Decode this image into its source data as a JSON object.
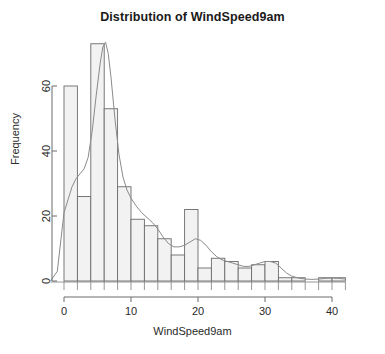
{
  "chart_data": {
    "type": "bar",
    "title": "Distribution of WindSpeed9am",
    "xlabel": "WindSpeed9am",
    "ylabel": "Frequency",
    "xlim": [
      -2,
      42
    ],
    "ylim": [
      0,
      76
    ],
    "grid": false,
    "legend": "none",
    "bin_width": 2,
    "bin_starts": [
      0,
      2,
      4,
      6,
      8,
      10,
      12,
      14,
      16,
      18,
      20,
      22,
      24,
      26,
      28,
      30,
      32,
      34,
      36,
      38,
      40
    ],
    "categories": [
      "0-2",
      "2-4",
      "4-6",
      "6-8",
      "8-10",
      "10-12",
      "12-14",
      "14-16",
      "16-18",
      "18-20",
      "20-22",
      "22-24",
      "24-26",
      "26-28",
      "28-30",
      "30-32",
      "32-34",
      "34-36",
      "36-38",
      "38-40",
      "40-42"
    ],
    "values": [
      60,
      26,
      73,
      53,
      29,
      19,
      17,
      13,
      8,
      22,
      4,
      7,
      6,
      4,
      5,
      6,
      1,
      1,
      0,
      1,
      1
    ],
    "xticks": [
      0,
      10,
      20,
      30,
      40
    ],
    "xtick_labels": [
      "0",
      "10",
      "20",
      "30",
      "40"
    ],
    "yticks": [
      0,
      20,
      40,
      60
    ],
    "ytick_labels": [
      "0",
      "20",
      "40",
      "60"
    ],
    "overlay": {
      "name": "density-curve",
      "type": "line",
      "x": [
        -2.0,
        -1.0,
        0.0,
        0.6,
        1.2,
        1.8,
        2.4,
        3.0,
        3.6,
        4.2,
        4.8,
        5.4,
        5.8,
        6.2,
        6.6,
        7.0,
        7.6,
        8.2,
        8.8,
        9.4,
        10.0,
        10.8,
        11.6,
        12.4,
        13.2,
        14.0,
        14.8,
        15.6,
        16.4,
        17.2,
        18.0,
        18.8,
        19.6,
        20.4,
        21.2,
        22.0,
        22.8,
        23.6,
        24.4,
        25.2,
        26.0,
        26.8,
        27.6,
        28.4,
        29.2,
        30.0,
        30.8,
        31.6,
        32.4,
        33.2,
        34.0,
        35.0,
        36.0,
        37.0,
        38.0,
        39.0,
        40.0,
        41.0,
        42.0
      ],
      "y": [
        0.0,
        3.0,
        21.0,
        25.0,
        29.0,
        31.5,
        33.0,
        34.5,
        38.0,
        46.0,
        57.0,
        67.0,
        72.0,
        73.5,
        70.0,
        63.0,
        50.0,
        39.0,
        32.0,
        28.0,
        25.5,
        23.0,
        21.0,
        19.5,
        18.0,
        16.0,
        13.5,
        11.5,
        10.5,
        10.5,
        11.0,
        12.0,
        13.0,
        12.5,
        11.0,
        9.0,
        7.5,
        6.5,
        6.0,
        5.5,
        5.0,
        4.5,
        4.5,
        5.0,
        5.5,
        6.0,
        6.0,
        5.5,
        4.0,
        2.5,
        1.5,
        0.9,
        0.6,
        0.5,
        0.6,
        0.8,
        0.9,
        0.8,
        0.6
      ]
    },
    "style": {
      "bar_fill": "#f2f2f2",
      "bar_stroke": "#6b6b6b",
      "curve_stroke": "#8a8a8a",
      "axis_stroke": "#6b6b6b",
      "background": "#ffffff"
    }
  }
}
